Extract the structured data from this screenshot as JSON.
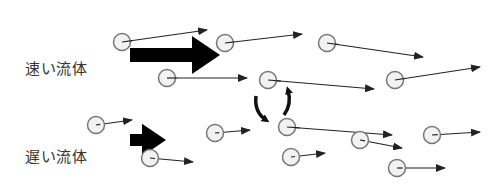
{
  "labels": {
    "fast_fluid": "速い流体",
    "slow_fluid": "遅い流体"
  },
  "colors": {
    "particle_fill": "#f2f2f2",
    "particle_stroke": "#777777",
    "arrow": "#222222",
    "flow_arrow": "#000000"
  },
  "particles": [
    {
      "x": 122,
      "y": 42,
      "tx": 207,
      "ty": 30
    },
    {
      "x": 225,
      "y": 43,
      "tx": 302,
      "ty": 34
    },
    {
      "x": 327,
      "y": 43,
      "tx": 423,
      "ty": 57
    },
    {
      "x": 167,
      "y": 78,
      "tx": 247,
      "ty": 78
    },
    {
      "x": 268,
      "y": 80,
      "tx": 374,
      "ty": 89
    },
    {
      "x": 395,
      "y": 80,
      "tx": 480,
      "ty": 67
    },
    {
      "x": 96,
      "y": 125,
      "tx": 132,
      "ty": 120
    },
    {
      "x": 215,
      "y": 133,
      "tx": 250,
      "ty": 130
    },
    {
      "x": 287,
      "y": 127,
      "tx": 392,
      "ty": 135
    },
    {
      "x": 360,
      "y": 140,
      "tx": 402,
      "ty": 148
    },
    {
      "x": 432,
      "y": 135,
      "tx": 480,
      "ty": 132
    },
    {
      "x": 150,
      "y": 158,
      "tx": 193,
      "ty": 162
    },
    {
      "x": 291,
      "y": 157,
      "tx": 325,
      "ty": 153
    },
    {
      "x": 397,
      "y": 168,
      "tx": 445,
      "ty": 168
    }
  ],
  "flow_arrows": [
    {
      "name": "fast-flow-arrow",
      "x1": 130,
      "y1": 55,
      "x2": 220,
      "y2": 55,
      "width": 14
    },
    {
      "name": "slow-flow-arrow",
      "x1": 130,
      "y1": 140,
      "x2": 166,
      "y2": 140,
      "width": 12
    }
  ]
}
